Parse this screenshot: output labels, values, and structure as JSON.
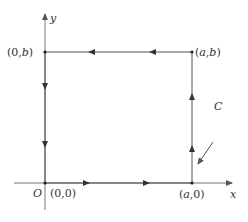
{
  "figure": {
    "type": "contour-path-diagram",
    "colors": {
      "line": "#555555",
      "axis": "#777777",
      "text": "#333333",
      "background": "#ffffff"
    },
    "axes": {
      "x_label": "x",
      "y_label": "y",
      "origin_label": "O"
    },
    "vertices": [
      {
        "id": "origin",
        "label": "(0,0)"
      },
      {
        "id": "a0",
        "label": "(a,0)"
      },
      {
        "id": "ab",
        "label": "(a,b)"
      },
      {
        "id": "0b",
        "label": "(0,b)"
      }
    ],
    "labels": {
      "origin_point": "(0,0)",
      "a0_point": "(a,0)",
      "ab_point": "(a,b)",
      "0b_point": "(0,b)",
      "curve": "C"
    },
    "path_segments": [
      {
        "from": "(0,0)",
        "to": "(a,0)",
        "direction": "right",
        "arrows": 2
      },
      {
        "from": "(a,0)",
        "to": "(a,b)",
        "direction": "up",
        "arrows": 2
      },
      {
        "from": "(a,b)",
        "to": "(0,b)",
        "direction": "left",
        "arrows": 2
      },
      {
        "from": "(0,b)",
        "to": "(0,0)",
        "direction": "down",
        "arrows": 2
      }
    ],
    "orientation": "counterclockwise"
  }
}
